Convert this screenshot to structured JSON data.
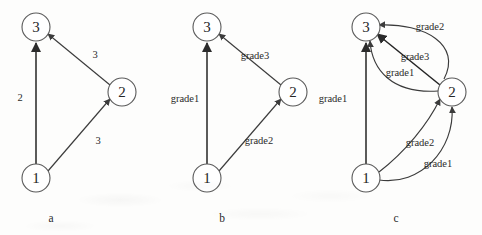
{
  "figure": {
    "background_color": "#fdfdfc",
    "stroke_color": "#3b3b3b",
    "node_stroke_color": "#5a5a5a",
    "text_color": "#262626"
  },
  "panels": [
    {
      "caption": "a",
      "caption_x": 51,
      "caption_y": 218,
      "nodes": [
        {
          "label": "3",
          "cx": 36,
          "cy": 27,
          "r": 14
        },
        {
          "label": "2",
          "cx": 122,
          "cy": 92,
          "r": 14
        },
        {
          "label": "1",
          "cx": 36,
          "cy": 178,
          "r": 14
        }
      ],
      "edges": [
        {
          "from": "1",
          "to": "3",
          "label": "2",
          "label_x": 20,
          "label_y": 97,
          "shape": "straight"
        },
        {
          "from": "2",
          "to": "3",
          "label": "3",
          "label_x": 95,
          "label_y": 54,
          "shape": "straight"
        },
        {
          "from": "1",
          "to": "2",
          "label": "3",
          "label_x": 98,
          "label_y": 140,
          "shape": "straight"
        }
      ]
    },
    {
      "caption": "b",
      "caption_x": 222,
      "caption_y": 218,
      "nodes": [
        {
          "label": "3",
          "cx": 207,
          "cy": 27,
          "r": 14
        },
        {
          "label": "2",
          "cx": 293,
          "cy": 92,
          "r": 14
        },
        {
          "label": "1",
          "cx": 207,
          "cy": 178,
          "r": 14
        }
      ],
      "edges": [
        {
          "from": "1",
          "to": "3",
          "label": "grade1",
          "label_x": 185,
          "label_y": 98,
          "shape": "straight"
        },
        {
          "from": "2",
          "to": "3",
          "label": "grade3",
          "label_x": 255,
          "label_y": 55,
          "shape": "straight"
        },
        {
          "from": "1",
          "to": "2",
          "label": "grade2",
          "label_x": 259,
          "label_y": 140,
          "shape": "straight"
        }
      ]
    },
    {
      "caption": "c",
      "caption_x": 396,
      "caption_y": 218,
      "nodes": [
        {
          "label": "3",
          "cx": 366,
          "cy": 27,
          "r": 14
        },
        {
          "label": "2",
          "cx": 452,
          "cy": 92,
          "r": 14
        },
        {
          "label": "1",
          "cx": 366,
          "cy": 178,
          "r": 14
        }
      ],
      "edges": [
        {
          "from": "1",
          "to": "3",
          "label": "grade1",
          "label_x": 333,
          "label_y": 98,
          "shape": "straight"
        },
        {
          "from": "2",
          "to": "3",
          "label": "grade2",
          "label_x": 430,
          "label_y": 26,
          "shape": "curve-outer"
        },
        {
          "from": "2",
          "to": "3",
          "label": "grade3",
          "label_x": 415,
          "label_y": 56,
          "shape": "straight"
        },
        {
          "from": "2",
          "to": "3",
          "label": "grade1",
          "label_x": 400,
          "label_y": 72,
          "shape": "curve-inner"
        },
        {
          "from": "1",
          "to": "2",
          "label": "grade2",
          "label_x": 420,
          "label_y": 142,
          "shape": "curve-inner"
        },
        {
          "from": "1",
          "to": "2",
          "label": "grade1",
          "label_x": 438,
          "label_y": 163,
          "shape": "curve-outer"
        }
      ]
    }
  ]
}
